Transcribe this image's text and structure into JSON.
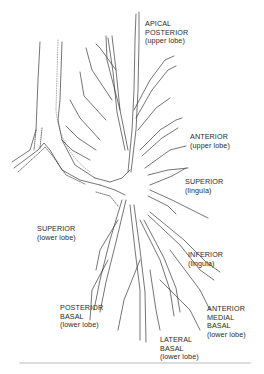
{
  "diagram": {
    "type": "anatomical-illustration",
    "labels": [
      {
        "id": "apical-posterior",
        "lines": [
          "APICAL",
          "POSTERIOR",
          "(upper lobe)"
        ]
      },
      {
        "id": "anterior-upper",
        "lines": [
          "ANTERIOR",
          "(upper lobe)"
        ]
      },
      {
        "id": "superior-lingula",
        "lines": [
          "SUPERIOR",
          "(lingula)"
        ]
      },
      {
        "id": "superior-lower",
        "lines": [
          "SUPERIOR",
          "(lower lobe)"
        ]
      },
      {
        "id": "inferior-lingula",
        "lines": [
          "INFERIOR",
          "(lingula)"
        ]
      },
      {
        "id": "anterior-medial-basal",
        "lines": [
          "ANTERIOR",
          "MEDIAL",
          "BASAL",
          "(lower lobe)"
        ]
      },
      {
        "id": "posterior-basal",
        "lines": [
          "POSTERIOR",
          "BASAL",
          "(lower lobe)"
        ]
      },
      {
        "id": "lateral-basal",
        "lines": [
          "LATERAL",
          "BASAL",
          "(lower lobe)"
        ]
      }
    ],
    "colors": {
      "line": "#3a3a3a",
      "text": "#2a2a2a",
      "background": "#ffffff"
    }
  }
}
